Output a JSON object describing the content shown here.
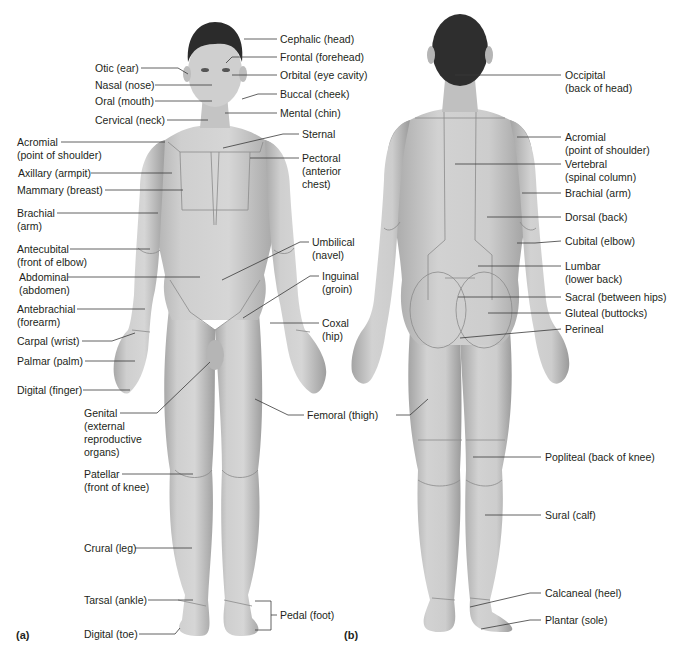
{
  "figure": {
    "panel_a": "(a)",
    "panel_b": "(b)",
    "colors": {
      "skin": "#c9c9c9",
      "skin_dark": "#a9a9a9",
      "hair": "#2b2b2b",
      "line": "#3a3a3a",
      "region_line": "#8a8a8a",
      "background": "#ffffff"
    }
  },
  "anterior": {
    "title": "Anterior view",
    "labels": [
      {
        "id": "otic",
        "text": "Otic (ear)",
        "x": 95,
        "y": 62
      },
      {
        "id": "nasal",
        "text": "Nasal (nose)",
        "x": 95,
        "y": 79
      },
      {
        "id": "oral",
        "text": "Oral (mouth)",
        "x": 95,
        "y": 95
      },
      {
        "id": "cervical",
        "text": "Cervical (neck)",
        "x": 95,
        "y": 114
      },
      {
        "id": "acromial",
        "text": "Acromial\n(point of shoulder)",
        "x": 17,
        "y": 136
      },
      {
        "id": "axillary",
        "text": "Axillary (armpit)",
        "x": 18,
        "y": 167
      },
      {
        "id": "mammary",
        "text": "Mammary (breast)",
        "x": 17,
        "y": 184
      },
      {
        "id": "brachial",
        "text": "Brachial\n(arm)",
        "x": 17,
        "y": 207
      },
      {
        "id": "antecubital",
        "text": "Antecubital\n(front of elbow)",
        "x": 17,
        "y": 243
      },
      {
        "id": "abdominal",
        "text": "Abdominal\n(abdomen)",
        "x": 19,
        "y": 271
      },
      {
        "id": "antebrachial",
        "text": "Antebrachial\n(forearm)",
        "x": 17,
        "y": 303
      },
      {
        "id": "carpal",
        "text": "Carpal (wrist)",
        "x": 17,
        "y": 335
      },
      {
        "id": "palmar",
        "text": "Palmar (palm)",
        "x": 17,
        "y": 355
      },
      {
        "id": "digital_finger",
        "text": "Digital (finger)",
        "x": 17,
        "y": 384
      },
      {
        "id": "genital",
        "text": "Genital\n(external\nreproductive\norgans)",
        "x": 84,
        "y": 407
      },
      {
        "id": "patellar",
        "text": "Patellar\n(front of knee)",
        "x": 84,
        "y": 468
      },
      {
        "id": "crural",
        "text": "Crural (leg)",
        "x": 84,
        "y": 542
      },
      {
        "id": "tarsal",
        "text": "Tarsal (ankle)",
        "x": 84,
        "y": 594
      },
      {
        "id": "digital_toe",
        "text": "Digital (toe)",
        "x": 84,
        "y": 628
      },
      {
        "id": "cephalic",
        "text": "Cephalic (head)",
        "x": 280,
        "y": 33
      },
      {
        "id": "frontal",
        "text": "Frontal (forehead)",
        "x": 280,
        "y": 51
      },
      {
        "id": "orbital",
        "text": "Orbital (eye cavity)",
        "x": 280,
        "y": 69
      },
      {
        "id": "buccal",
        "text": "Buccal (cheek)",
        "x": 280,
        "y": 88
      },
      {
        "id": "mental",
        "text": "Mental (chin)",
        "x": 280,
        "y": 107
      },
      {
        "id": "sternal",
        "text": "Sternal",
        "x": 302,
        "y": 128
      },
      {
        "id": "pectoral",
        "text": "Pectoral\n(anterior\nchest)",
        "x": 302,
        "y": 152
      },
      {
        "id": "umbilical",
        "text": "Umbilical\n(navel)",
        "x": 312,
        "y": 236
      },
      {
        "id": "inguinal",
        "text": "Inguinal\n(groin)",
        "x": 322,
        "y": 270
      },
      {
        "id": "coxal",
        "text": "Coxal\n(hip)",
        "x": 322,
        "y": 317
      },
      {
        "id": "femoral",
        "text": "Femoral (thigh)",
        "x": 307,
        "y": 409
      },
      {
        "id": "pedal",
        "text": "Pedal (foot)",
        "x": 280,
        "y": 609
      }
    ]
  },
  "posterior": {
    "title": "Posterior view",
    "labels": [
      {
        "id": "occipital",
        "text": "Occipital\n(back of head)",
        "x": 565,
        "y": 69
      },
      {
        "id": "acromial_post",
        "text": "Acromial\n(point of shoulder)",
        "x": 565,
        "y": 131
      },
      {
        "id": "vertebral",
        "text": "Vertebral\n(spinal column)",
        "x": 565,
        "y": 158
      },
      {
        "id": "brachial_post",
        "text": "Brachial (arm)",
        "x": 565,
        "y": 187
      },
      {
        "id": "dorsal",
        "text": "Dorsal (back)",
        "x": 565,
        "y": 211
      },
      {
        "id": "cubital",
        "text": "Cubital (elbow)",
        "x": 565,
        "y": 235
      },
      {
        "id": "lumbar",
        "text": "Lumbar\n(lower back)",
        "x": 565,
        "y": 260
      },
      {
        "id": "sacral",
        "text": "Sacral (between hips)",
        "x": 565,
        "y": 291
      },
      {
        "id": "gluteal",
        "text": "Gluteal (buttocks)",
        "x": 565,
        "y": 307
      },
      {
        "id": "perineal",
        "text": "Perineal",
        "x": 565,
        "y": 323
      },
      {
        "id": "femoral_post",
        "text": "",
        "x": 0,
        "y": 0
      },
      {
        "id": "popliteal",
        "text": "Popliteal (back of knee)",
        "x": 545,
        "y": 451
      },
      {
        "id": "sural",
        "text": "Sural (calf)",
        "x": 545,
        "y": 509
      },
      {
        "id": "calcaneal",
        "text": "Calcaneal (heel)",
        "x": 545,
        "y": 587
      },
      {
        "id": "plantar",
        "text": "Plantar (sole)",
        "x": 545,
        "y": 614
      }
    ]
  }
}
